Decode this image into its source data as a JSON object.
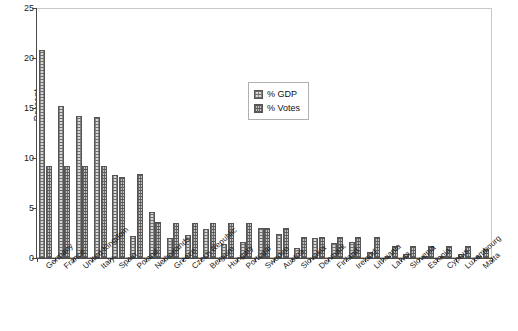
{
  "chart_data": {
    "type": "bar",
    "title": "",
    "xlabel": "",
    "ylabel": "Percent",
    "ylim": [
      0,
      25
    ],
    "yticks": [
      0,
      5,
      10,
      15,
      20,
      25
    ],
    "grid": false,
    "legend_position": "inside-upper-center",
    "categories": [
      "Germany",
      "France",
      "United Kingdom",
      "Italy",
      "Spain",
      "Poland",
      "Netherlands",
      "Greece",
      "Czech Republic",
      "Belgium",
      "Hungary",
      "Portugal",
      "Sweden",
      "Austria",
      "Slovakia",
      "Denmark",
      "Finland",
      "Ireland",
      "Lithuania",
      "Latvia",
      "Slovenia",
      "Estonia",
      "Cyprus",
      "Luxembourg",
      "Malta"
    ],
    "series": [
      {
        "name": "% GDP",
        "values": [
          20.8,
          15.2,
          14.2,
          14.1,
          8.3,
          2.2,
          4.6,
          2.0,
          2.3,
          2.9,
          1.4,
          1.6,
          3.0,
          2.4,
          1.0,
          2.0,
          1.5,
          1.6,
          0.6,
          0.2,
          0.4,
          0.2,
          0.2,
          0.4,
          0.1
        ]
      },
      {
        "name": "% Votes",
        "values": [
          9.2,
          9.2,
          9.2,
          9.2,
          8.1,
          8.4,
          3.6,
          3.5,
          3.5,
          3.5,
          3.5,
          3.5,
          3.0,
          3.0,
          2.1,
          2.1,
          2.1,
          2.1,
          2.1,
          1.2,
          1.2,
          1.2,
          1.2,
          1.2,
          0.9
        ]
      }
    ]
  },
  "legend": {
    "entries": [
      {
        "label": "% GDP",
        "key": "gdp"
      },
      {
        "label": "% Votes",
        "key": "votes"
      }
    ]
  }
}
